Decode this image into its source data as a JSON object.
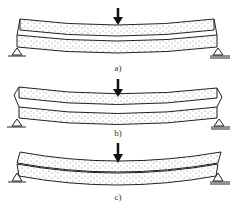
{
  "figure": {
    "panels": [
      {
        "id": "a",
        "label": "a)",
        "description": "two stacked layers bending as separate beams, both supported at ends"
      },
      {
        "id": "b",
        "label": "b)",
        "description": "two layers partially bonded, with slip at ends"
      },
      {
        "id": "c",
        "label": "c)",
        "description": "two layers bending, upper layer extends beyond supports"
      }
    ],
    "colors": {
      "line": "#222222",
      "dots": "#555555",
      "fill": "#ffffff"
    },
    "load_icon": "down-arrow-icon",
    "support_icon": "triangle-support-icon"
  }
}
